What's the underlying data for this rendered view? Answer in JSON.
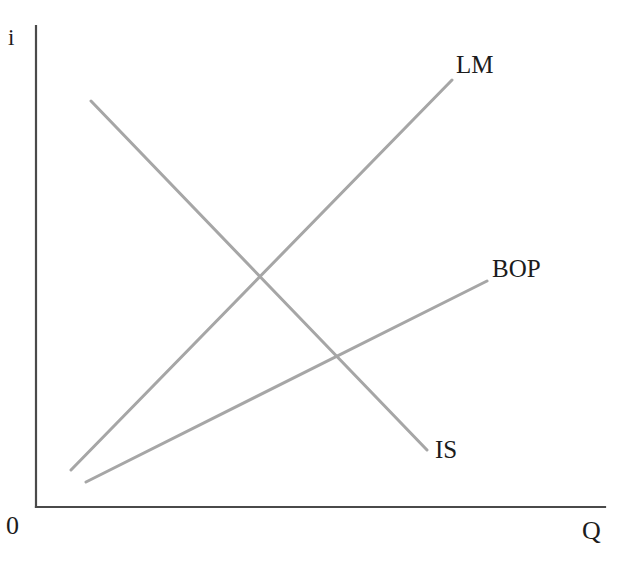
{
  "figure": {
    "background_color": "#ffffff",
    "axis_color": "#4a4a4a",
    "curve_color": "#a6a6a6",
    "text_color": "#1c1c1c"
  },
  "axes": {
    "y_axis_label": "i",
    "x_axis_label": "Q",
    "origin_label": "0"
  },
  "curves": {
    "lm": {
      "label": "LM"
    },
    "bop": {
      "label": "BOP"
    },
    "is": {
      "label": "IS"
    }
  },
  "chart_data": {
    "type": "line",
    "title": "",
    "subtitle": "",
    "xlabel": "Q",
    "ylabel": "i",
    "origin_label": "0",
    "grid": false,
    "legend": "inline-endpoint-labels",
    "axis_ranges": {
      "xlim": [
        0,
        1
      ],
      "ylim": [
        0,
        1
      ]
    },
    "axis_pixels": {
      "origin": [
        36,
        507
      ],
      "y_axis_top": [
        36,
        26
      ],
      "x_axis_right": [
        605,
        507
      ]
    },
    "series": [
      {
        "name": "IS",
        "label": "IS",
        "slope": "negative",
        "color": "#a6a6a6",
        "points_px": [
          [
            91,
            101
          ],
          [
            427,
            450
          ]
        ],
        "label_position_px": [
          435,
          437
        ]
      },
      {
        "name": "LM",
        "label": "LM",
        "slope": "positive",
        "color": "#a6a6a6",
        "points_px": [
          [
            71,
            470
          ],
          [
            452,
            80
          ]
        ],
        "label_position_px": [
          456,
          52
        ]
      },
      {
        "name": "BOP",
        "label": "BOP",
        "slope": "positive-shallow",
        "color": "#a6a6a6",
        "points_px": [
          [
            86,
            482
          ],
          [
            487,
            281
          ]
        ],
        "label_position_px": [
          492,
          256
        ]
      }
    ],
    "intersections_px": [
      {
        "between": [
          "IS",
          "LM"
        ],
        "point": [
          260,
          275
        ]
      },
      {
        "between": [
          "IS",
          "BOP"
        ],
        "point": [
          336,
          352
        ]
      }
    ],
    "annotations": []
  }
}
